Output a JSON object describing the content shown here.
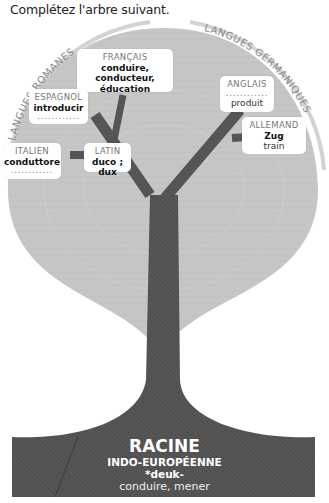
{
  "instruction": "Complétez l'arbre suivant.",
  "arcs": {
    "left_label": "LANGUES ROMANES",
    "right_label": "LANGUES GERMANIQUES"
  },
  "nodes": {
    "francais": {
      "lang": "FRANÇAIS",
      "line1": "conduire, conducteur,",
      "line2": "éducation"
    },
    "espagnol": {
      "lang": "ESPAGNOL",
      "word": "introducir",
      "blank": "............"
    },
    "italien": {
      "lang": "ITALIEN",
      "word": "conduttore",
      "blank": "............"
    },
    "latin": {
      "lang": "LATIN",
      "word": "duco ; dux"
    },
    "anglais": {
      "lang": "ANGLAIS",
      "blank": "............",
      "word": "produit"
    },
    "allemand": {
      "lang": "ALLEMAND",
      "word": "Zug",
      "translation": "train"
    }
  },
  "root": {
    "title": "RACINE",
    "subtitle": "INDO-EUROPÉENNE",
    "stem": "*deuk-",
    "meaning": "conduire, mener"
  },
  "colors": {
    "crown": "#c4c4c4",
    "trunk": "#555555",
    "arc": "#d0d0d0",
    "root_bg": "#4e4e4e"
  }
}
